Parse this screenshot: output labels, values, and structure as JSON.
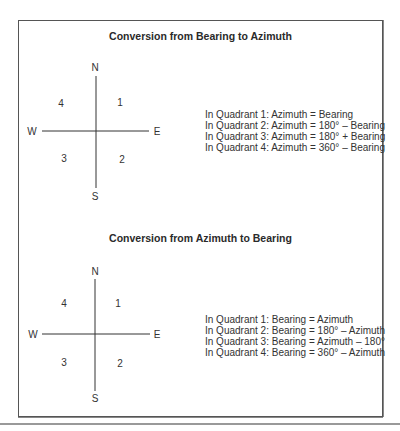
{
  "figure": {
    "sections": [
      {
        "title": "Conversion from Bearing to Azimuth",
        "compass": {
          "directions": {
            "north": "N",
            "south": "S",
            "east": "E",
            "west": "W"
          },
          "quadrants": {
            "q1": "1",
            "q2": "2",
            "q3": "3",
            "q4": "4"
          }
        },
        "rules": [
          "In Quadrant 1:  Azimuth = Bearing",
          "In Quadrant 2:  Azimuth = 180° – Bearing",
          "In Quadrant 3:  Azimuth = 180° + Bearing",
          "In Quadrant 4:  Azimuth = 360° – Bearing"
        ]
      },
      {
        "title": "Conversion from Azimuth to Bearing",
        "compass": {
          "directions": {
            "north": "N",
            "south": "S",
            "east": "E",
            "west": "W"
          },
          "quadrants": {
            "q1": "1",
            "q2": "2",
            "q3": "3",
            "q4": "4"
          }
        },
        "rules": [
          "In Quadrant 1:  Bearing = Azimuth",
          "In Quadrant 2:  Bearing = 180° – Azimuth",
          "In Quadrant 3:  Bearing = Azimuth – 180°",
          "In Quadrant 4:  Bearing = 360° – Azimuth"
        ]
      }
    ]
  }
}
